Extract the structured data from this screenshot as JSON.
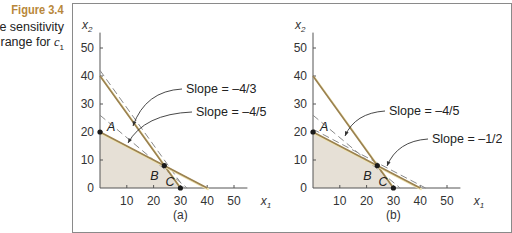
{
  "figure": {
    "title": "Figure 3.4",
    "desc_line1": "he sensitivity",
    "desc_line2_prefix": "range for ",
    "desc_var": "c",
    "desc_sub": "1"
  },
  "colors": {
    "title": "#b8873a",
    "constraint": "#9a8150",
    "highlight": "#efe3b0",
    "fill": "#e6e0d6",
    "dashed": "#8a8a8a",
    "axis": "#555555",
    "point": "#1a1a1a"
  },
  "chart_data": [
    {
      "type": "line",
      "panel_label": "(a)",
      "xlabel": "x1",
      "ylabel": "x2",
      "xlim": [
        0,
        55
      ],
      "ylim": [
        0,
        55
      ],
      "xticks": [
        10,
        20,
        30,
        40,
        50
      ],
      "yticks": [
        0,
        10,
        20,
        30,
        40,
        50
      ],
      "feasible_region": [
        [
          0,
          0
        ],
        [
          0,
          20
        ],
        [
          24,
          8
        ],
        [
          30,
          0
        ]
      ],
      "constraints": [
        {
          "name": "constraint-1",
          "points": [
            [
              0,
              40
            ],
            [
              30,
              0
            ]
          ]
        },
        {
          "name": "constraint-2",
          "points": [
            [
              0,
              20
            ],
            [
              40,
              0
            ]
          ]
        }
      ],
      "objective_lines": [
        {
          "name": "slope-neg-4-3",
          "slope": "-4/3",
          "points": [
            [
              0,
              42
            ],
            [
              31.5,
              0
            ]
          ]
        },
        {
          "name": "slope-neg-4-5",
          "slope": "-4/5",
          "points": [
            [
              0,
              26
            ],
            [
              32.5,
              0
            ]
          ]
        }
      ],
      "points": [
        {
          "label": "A",
          "x": 0,
          "y": 20
        },
        {
          "label": "B",
          "x": 24,
          "y": 8
        },
        {
          "label": "C",
          "x": 30,
          "y": 0
        }
      ],
      "annotations": [
        {
          "text": "Slope = –4/3",
          "text_x": 186,
          "text_y": 93,
          "arrow_to": [
            133,
            126
          ]
        },
        {
          "text": "Slope = –4/5",
          "text_x": 196,
          "text_y": 116,
          "arrow_to": [
            128,
            143
          ]
        }
      ]
    },
    {
      "type": "line",
      "panel_label": "(b)",
      "xlabel": "x1",
      "ylabel": "x2",
      "xlim": [
        0,
        55
      ],
      "ylim": [
        0,
        55
      ],
      "xticks": [
        10,
        20,
        30,
        40,
        50
      ],
      "yticks": [
        0,
        10,
        20,
        30,
        40,
        50
      ],
      "feasible_region": [
        [
          0,
          0
        ],
        [
          0,
          20
        ],
        [
          24,
          8
        ],
        [
          30,
          0
        ]
      ],
      "constraints": [
        {
          "name": "constraint-1",
          "points": [
            [
              0,
              40
            ],
            [
              30,
              0
            ]
          ]
        },
        {
          "name": "constraint-2",
          "points": [
            [
              0,
              20
            ],
            [
              40,
              0
            ]
          ]
        }
      ],
      "objective_lines": [
        {
          "name": "slope-neg-4-5",
          "slope": "-4/5",
          "points": [
            [
              0,
              26
            ],
            [
              32.5,
              0
            ]
          ]
        },
        {
          "name": "slope-neg-1-2",
          "slope": "-1/2",
          "points": [
            [
              0,
              21
            ],
            [
              42,
              0
            ]
          ]
        }
      ],
      "points": [
        {
          "label": "A",
          "x": 0,
          "y": 20
        },
        {
          "label": "B",
          "x": 24,
          "y": 8
        },
        {
          "label": "C",
          "x": 30,
          "y": 0
        }
      ],
      "annotations": [
        {
          "text": "Slope = –4/5",
          "text_x": 389,
          "text_y": 115,
          "arrow_to": [
            345,
            136
          ]
        },
        {
          "text": "Slope = –1/2",
          "text_x": 432,
          "text_y": 143,
          "arrow_to": [
            387,
            166
          ]
        }
      ]
    }
  ],
  "layout": {
    "panels": [
      {
        "origin_x": 100,
        "origin_y": 188,
        "px_per_unit_x": 2.68,
        "px_per_unit_y": 2.8
      },
      {
        "origin_x": 313,
        "origin_y": 188,
        "px_per_unit_x": 2.68,
        "px_per_unit_y": 2.8
      }
    ]
  }
}
